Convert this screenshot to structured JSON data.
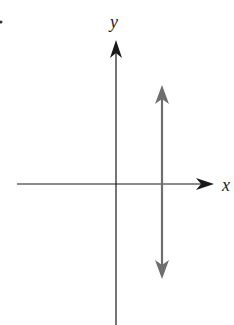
{
  "diagram": {
    "x_axis_label": "x",
    "y_axis_label": "y",
    "colors": {
      "axes": "#1a1a1a",
      "vertical_line": "#6e6e6e"
    }
  }
}
